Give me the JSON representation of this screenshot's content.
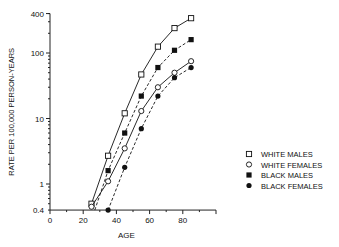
{
  "chart_data": {
    "type": "line",
    "title": "",
    "xlabel": "AGE",
    "ylabel": "RATE PER 100,000 PERSON-YEARS",
    "xlim": [
      0,
      100
    ],
    "ylim": [
      0.4,
      400
    ],
    "yscale": "log",
    "grid": false,
    "legend_position": "right",
    "x_ticks": [
      0,
      20,
      40,
      60,
      80
    ],
    "y_ticks": [
      0.4,
      1,
      10,
      100,
      400
    ],
    "y_tick_labels": [
      "0.4",
      "1",
      "10",
      "100",
      "400"
    ],
    "x": [
      25,
      35,
      45,
      55,
      65,
      75,
      85
    ],
    "series": [
      {
        "name": "WHITE MALES",
        "marker": "open-square",
        "line": "solid",
        "values": [
          0.5,
          2.7,
          12,
          47,
          125,
          240,
          340
        ]
      },
      {
        "name": "WHITE FEMALES",
        "marker": "open-circle",
        "line": "solid",
        "values": [
          0.45,
          1.1,
          3.5,
          13,
          30,
          50,
          75
        ]
      },
      {
        "name": "BLACK MALES",
        "marker": "filled-square",
        "line": "dashed",
        "values": [
          null,
          1.6,
          6,
          22,
          60,
          110,
          160
        ]
      },
      {
        "name": "BLACK FEMALES",
        "marker": "filled-circle",
        "line": "dashed",
        "values": [
          null,
          0.4,
          1.8,
          7,
          22,
          42,
          60
        ]
      }
    ]
  }
}
